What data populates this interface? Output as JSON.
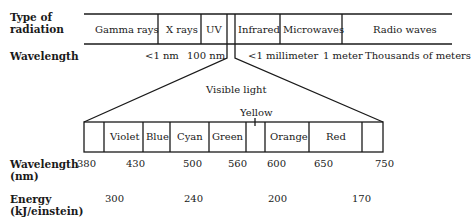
{
  "labels": {
    "type_of_radiation": [
      "Type of",
      "radiation"
    ],
    "wavelength": "Wavelength",
    "wavelength_nm": [
      "Wavelength",
      "(nm)"
    ],
    "energy": [
      "Energy",
      "(kJ/einstein)"
    ],
    "visible_light": "Visible light",
    "yellow": "Yellow"
  },
  "spectrum": {
    "bands": [
      "Gamma rays",
      "X rays",
      "UV",
      "Infrared",
      "Microwaves",
      "Radio waves"
    ],
    "wavelength_marks": [
      "<1 nm",
      "100 nm",
      "<1 millimeter",
      "1 meter",
      "Thousands of meters"
    ]
  },
  "visible": {
    "bands": [
      "Violet",
      "Blue",
      "Cyan",
      "Green",
      "Orange",
      "Red"
    ],
    "wavelengths_nm": [
      "380",
      "430",
      "500",
      "560",
      "600",
      "650",
      "750"
    ],
    "energies": [
      "300",
      "240",
      "200",
      "170"
    ]
  }
}
